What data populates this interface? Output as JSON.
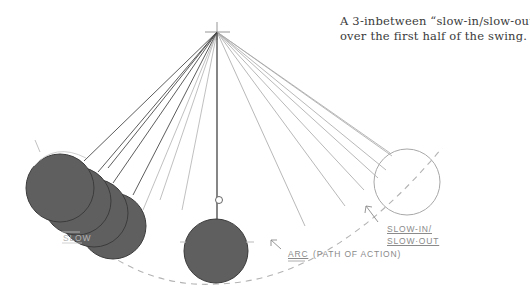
{
  "caption": {
    "line1": "A 3-inbetween “slow-in/slow-out”",
    "line2": "over the first half of the swing."
  },
  "labels": {
    "slow_in_line1": "SLOW-IN/",
    "slow_in_line2": "SLOW·OUT",
    "left_partial": "SLOW",
    "arc": "ARC",
    "arc_note": "(PATH OF ACTION)"
  },
  "colors": {
    "bob_fill": "#5f5f5f",
    "bob_stroke": "#3c3c3c",
    "outline_bob": "#a8a8a8",
    "string_dark": "#4a4a4a",
    "string_light": "#a6a6a6",
    "arc": "#b3b3b3",
    "caption_text": "#3a3a3a"
  },
  "pivot": {
    "x": 217,
    "y": 32
  },
  "bobs": [
    {
      "role": "extreme-left",
      "x": 60,
      "y": 188,
      "r": 34,
      "filled": true
    },
    {
      "role": "inbetween-1",
      "x": 77,
      "y": 201,
      "r": 34,
      "filled": true
    },
    {
      "role": "inbetween-2",
      "x": 94,
      "y": 213,
      "r": 34,
      "filled": true
    },
    {
      "role": "inbetween-3",
      "x": 113,
      "y": 226,
      "r": 33,
      "filled": true
    },
    {
      "role": "rest",
      "x": 216,
      "y": 251,
      "r": 32,
      "filled": true
    },
    {
      "role": "extreme-right",
      "x": 407,
      "y": 182,
      "r": 33,
      "filled": false
    }
  ]
}
